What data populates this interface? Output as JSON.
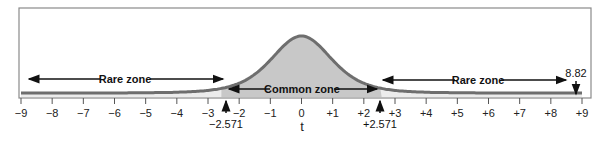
{
  "chart_data": {
    "type": "area",
    "title": "",
    "xlabel": "t",
    "ylabel": "",
    "xlim": [
      -9,
      9
    ],
    "x_ticks": [
      -9,
      -8,
      -7,
      -6,
      -5,
      -4,
      -3,
      -2,
      -1,
      0,
      1,
      2,
      3,
      4,
      5,
      6,
      7,
      8,
      9
    ],
    "x_tick_labels": [
      "−9",
      "−8",
      "−7",
      "−6",
      "−5",
      "−4",
      "−3",
      "−2",
      "−1",
      "0",
      "+1",
      "+2",
      "+3",
      "+4",
      "+5",
      "+6",
      "+7",
      "+8",
      "+9"
    ],
    "distribution": "t",
    "critical_values": [
      -2.571,
      2.571
    ],
    "critical_labels": [
      "−2.571",
      "+2.571"
    ],
    "observed_value": 8.82,
    "observed_label": "8.82",
    "zones": [
      {
        "name": "Rare zone",
        "from": -9,
        "to": -2.571
      },
      {
        "name": "Common zone",
        "from": -2.571,
        "to": 2.571
      },
      {
        "name": "Rare zone",
        "from": 2.571,
        "to": 9
      }
    ],
    "colors": {
      "curve": "#6e6e6e",
      "common_fill": "#c8c8c8",
      "rare_fill": "#ececec",
      "frame": "#8a8a8a"
    },
    "grid": false,
    "legend": "none"
  },
  "labels": {
    "rare_left": "Rare zone",
    "common": "Common zone",
    "rare_right": "Rare zone",
    "crit_neg": "−2.571",
    "crit_pos": "+2.571",
    "observed": "8.82",
    "xlabel": "t",
    "ticks": [
      "−9",
      "−8",
      "−7",
      "−6",
      "−5",
      "−4",
      "−3",
      "−2",
      "−1",
      "0",
      "+1",
      "+2",
      "+3",
      "+4",
      "+5",
      "+6",
      "+7",
      "+8",
      "+9"
    ]
  }
}
